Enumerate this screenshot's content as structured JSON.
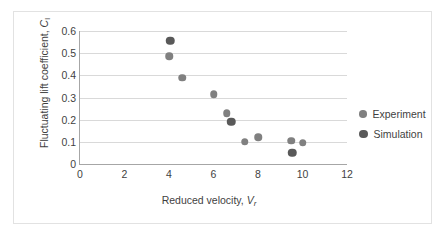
{
  "chart_data": {
    "type": "scatter",
    "title": "",
    "xlabel": "Reduced velocity, Vr",
    "ylabel": "Fluctuating lift coefficient, Cl",
    "xlabel_parts": {
      "text": "Reduced velocity, ",
      "italic": "V",
      "subscript": "r"
    },
    "ylabel_parts": {
      "text": "Fluctuating lift coefficient, ",
      "italic": "C",
      "subscript": "l"
    },
    "xlim": [
      0,
      12
    ],
    "ylim": [
      0,
      0.6
    ],
    "xticks": [
      "0",
      "2",
      "4",
      "6",
      "8",
      "10",
      "12"
    ],
    "xtick_values": [
      0,
      2,
      4,
      6,
      8,
      10,
      12
    ],
    "yticks": [
      "0",
      "0.1",
      "0.2",
      "0.3",
      "0.4",
      "0.5",
      "0.6"
    ],
    "ytick_values": [
      0,
      0.1,
      0.2,
      0.3,
      0.4,
      0.5,
      0.6
    ],
    "grid": "horizontal",
    "legend_position": "right",
    "series": [
      {
        "name": "Experiment",
        "color": "#808080",
        "marker": "circle",
        "points": [
          {
            "x": 4.0,
            "y": 0.485
          },
          {
            "x": 4.6,
            "y": 0.39
          },
          {
            "x": 6.0,
            "y": 0.315
          },
          {
            "x": 6.6,
            "y": 0.23
          },
          {
            "x": 7.4,
            "y": 0.1
          },
          {
            "x": 8.0,
            "y": 0.12
          },
          {
            "x": 9.5,
            "y": 0.105
          },
          {
            "x": 10.0,
            "y": 0.095
          }
        ]
      },
      {
        "name": "Simulation",
        "color": "#595959",
        "marker": "circle",
        "points": [
          {
            "x": 4.05,
            "y": 0.555
          },
          {
            "x": 6.8,
            "y": 0.19
          },
          {
            "x": 9.55,
            "y": 0.05
          }
        ]
      }
    ]
  },
  "legend": {
    "entries": [
      {
        "label": "Experiment",
        "color": "#808080"
      },
      {
        "label": "Simulation",
        "color": "#595959"
      }
    ]
  },
  "colors": {
    "experiment": "#808080",
    "simulation": "#595959",
    "gridline": "#d9d9d9",
    "axis": "#a6a6a6",
    "text": "#3f3f3f",
    "frame": "#e2e2e2",
    "background": "#ffffff"
  }
}
